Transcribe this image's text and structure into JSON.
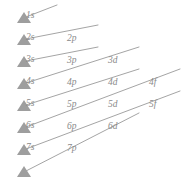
{
  "diagram": {
    "name": "aufbau-diagonal-rule",
    "background_color": "#ffffff",
    "line_color": "#9a9a9a",
    "marker_color": "#9e9e9e",
    "label_color": "#8a8a8a",
    "columns": [
      {
        "key": "s",
        "label": "s",
        "x": 24
      },
      {
        "key": "p",
        "label": "p",
        "x": 66
      },
      {
        "key": "d",
        "label": "d",
        "x": 107
      },
      {
        "key": "f",
        "label": "f",
        "x": 148
      }
    ],
    "rows": [
      {
        "n": 1,
        "y": 18
      },
      {
        "n": 2,
        "y": 40
      },
      {
        "n": 3,
        "y": 62
      },
      {
        "n": 4,
        "y": 84
      },
      {
        "n": 5,
        "y": 106
      },
      {
        "n": 6,
        "y": 128
      },
      {
        "n": 7,
        "y": 150
      },
      {
        "n": 8,
        "y": 172
      }
    ],
    "markers": [
      {
        "id": "marker-1s",
        "x": 18,
        "y": 18,
        "label": "1s"
      },
      {
        "id": "marker-2s",
        "x": 18,
        "y": 40,
        "label": "2s"
      },
      {
        "id": "marker-3s",
        "x": 18,
        "y": 62,
        "label": "3s"
      },
      {
        "id": "marker-4s",
        "x": 18,
        "y": 84,
        "label": "4s"
      },
      {
        "id": "marker-5s",
        "x": 18,
        "y": 106,
        "label": "5s"
      },
      {
        "id": "marker-6s",
        "x": 18,
        "y": 128,
        "label": "6s"
      },
      {
        "id": "marker-7s",
        "x": 18,
        "y": 150,
        "label": "7s"
      },
      {
        "id": "marker-8s",
        "x": 18,
        "y": 172,
        "label": ""
      }
    ],
    "labels": [
      {
        "id": "label-1s",
        "text": "1s",
        "x": 26,
        "y": 11
      },
      {
        "id": "label-2s",
        "text": "2s",
        "x": 26,
        "y": 33
      },
      {
        "id": "label-3s",
        "text": "3s",
        "x": 26,
        "y": 55
      },
      {
        "id": "label-4s",
        "text": "4s",
        "x": 26,
        "y": 77
      },
      {
        "id": "label-5s",
        "text": "5s",
        "x": 26,
        "y": 99
      },
      {
        "id": "label-6s",
        "text": "6s",
        "x": 26,
        "y": 121
      },
      {
        "id": "label-7s",
        "text": "7s",
        "x": 26,
        "y": 143
      },
      {
        "id": "label-2p",
        "text": "2p",
        "x": 67,
        "y": 34
      },
      {
        "id": "label-3p",
        "text": "3p",
        "x": 67,
        "y": 56
      },
      {
        "id": "label-4p",
        "text": "4p",
        "x": 67,
        "y": 78
      },
      {
        "id": "label-5p",
        "text": "5p",
        "x": 67,
        "y": 100
      },
      {
        "id": "label-6p",
        "text": "6p",
        "x": 67,
        "y": 122
      },
      {
        "id": "label-7p",
        "text": "7p",
        "x": 67,
        "y": 144
      },
      {
        "id": "label-3d",
        "text": "3d",
        "x": 108,
        "y": 56
      },
      {
        "id": "label-4d",
        "text": "4d",
        "x": 108,
        "y": 78
      },
      {
        "id": "label-5d",
        "text": "5d",
        "x": 108,
        "y": 100
      },
      {
        "id": "label-6d",
        "text": "6d",
        "x": 108,
        "y": 122
      },
      {
        "id": "label-4f",
        "text": "4f",
        "x": 149,
        "y": 78
      },
      {
        "id": "label-5f",
        "text": "5f",
        "x": 149,
        "y": 100
      }
    ],
    "arrows": [
      {
        "id": "arrow-1",
        "from": "1s",
        "to": "1s",
        "x1": 24,
        "y1": 18,
        "x2": 48,
        "y2": 6
      },
      {
        "id": "arrow-2",
        "from": "2s",
        "to": "2p",
        "x1": 24,
        "y1": 40,
        "x2": 90,
        "y2": 28
      },
      {
        "id": "arrow-3",
        "from": "3s",
        "to": "3p",
        "x1": 24,
        "y1": 62,
        "x2": 90,
        "y2": 50
      },
      {
        "id": "arrow-4",
        "from": "4s",
        "to": "3d",
        "x1": 24,
        "y1": 84,
        "x2": 131,
        "y2": 50
      },
      {
        "id": "arrow-5",
        "from": "5s",
        "to": "4d",
        "x1": 24,
        "y1": 106,
        "x2": 131,
        "y2": 72
      },
      {
        "id": "arrow-6",
        "from": "6s",
        "to": "4f",
        "x1": 24,
        "y1": 128,
        "x2": 172,
        "y2": 72
      },
      {
        "id": "arrow-7",
        "from": "7s",
        "to": "5f",
        "x1": 24,
        "y1": 150,
        "x2": 172,
        "y2": 94
      },
      {
        "id": "arrow-8",
        "from": "8s",
        "to": "6d",
        "x1": 24,
        "y1": 172,
        "x2": 131,
        "y2": 116
      }
    ],
    "filling_order": [
      "1s",
      "2s",
      "2p",
      "3s",
      "3p",
      "4s",
      "3d",
      "4p",
      "5s",
      "4d",
      "5p",
      "6s",
      "4f",
      "5d",
      "6p",
      "7s",
      "5f",
      "6d",
      "7p"
    ]
  }
}
